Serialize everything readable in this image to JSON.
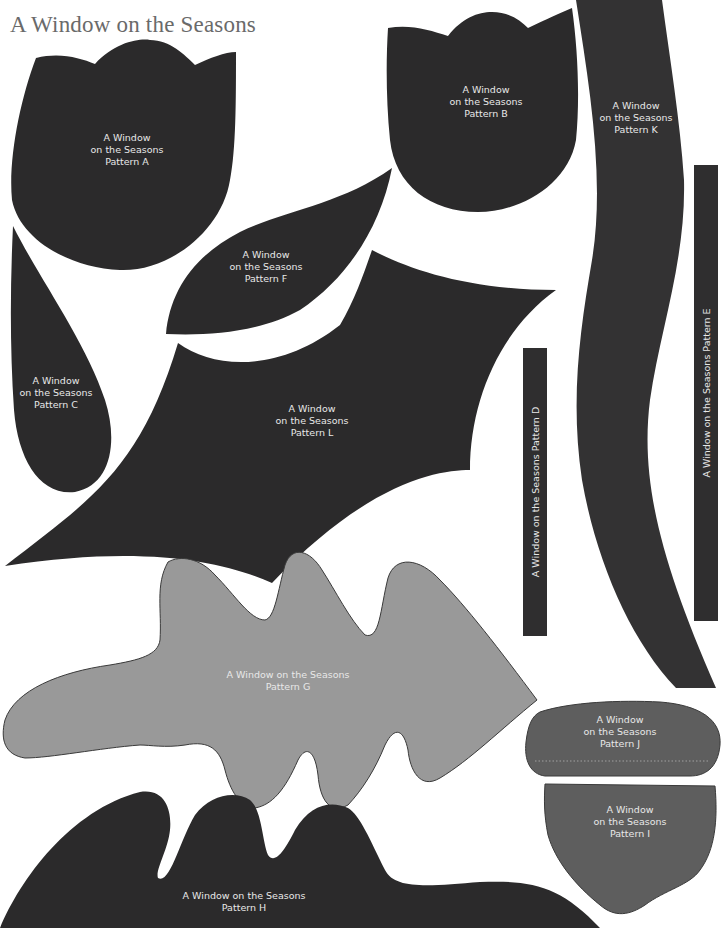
{
  "document": {
    "title": "A Window on the Seasons",
    "colors": {
      "dark_piece": "#2b2a2b",
      "medium_piece": "#5e5e5e",
      "light_piece": "#9a9a9a",
      "label_text": "#e8e8e8",
      "title_text": "#6a6a6a"
    }
  },
  "patterns": {
    "A": {
      "label": "A Window\non the Seasons\nPattern A"
    },
    "B": {
      "label": "A Window\non the Seasons\nPattern B"
    },
    "C": {
      "label": "A Window\non the Seasons\nPattern C"
    },
    "D": {
      "label": "A Window on the Seasons Pattern D"
    },
    "E": {
      "label": "A Window on the Seasons Pattern E"
    },
    "F": {
      "label": "A Window\non the Seasons\nPattern F"
    },
    "G": {
      "label": "A Window on the Seasons\nPattern G"
    },
    "H": {
      "label": "A Window on the Seasons\nPattern H"
    },
    "I": {
      "label": "A Window\non the Seasons\nPattern I"
    },
    "J": {
      "label": "A Window\non the Seasons\nPattern J"
    },
    "K": {
      "label": "A Window\non the Seasons\nPattern K"
    },
    "L": {
      "label": "A Window\non the Seasons\nPattern L"
    }
  }
}
